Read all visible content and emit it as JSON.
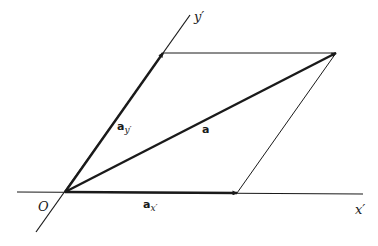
{
  "diagram": {
    "type": "vector decomposition in oblique coordinates",
    "colors": {
      "stroke": "#1a1a1a",
      "background": "#ffffff"
    },
    "labels": {
      "origin": "O",
      "x_axis": "x′",
      "y_axis": "y′",
      "vector_a": "a",
      "vector_ax_base": "a",
      "vector_ax_sub": "x′",
      "vector_ay_base": "a",
      "vector_ay_sub": "y′"
    },
    "points": {
      "origin": [
        65,
        192
      ],
      "ax_tip": [
        237,
        193
      ],
      "ay_tip": [
        163,
        53
      ],
      "a_tip": [
        336,
        53
      ]
    }
  }
}
